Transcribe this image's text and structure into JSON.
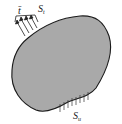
{
  "diagram": {
    "body_fill": "#a9a9a9",
    "body_stroke": "#1a1a1a",
    "traction_label": "t̄",
    "traction_boundary_label": "S",
    "traction_boundary_sub": "t",
    "displacement_boundary_label": "S",
    "displacement_boundary_sub": "u"
  }
}
